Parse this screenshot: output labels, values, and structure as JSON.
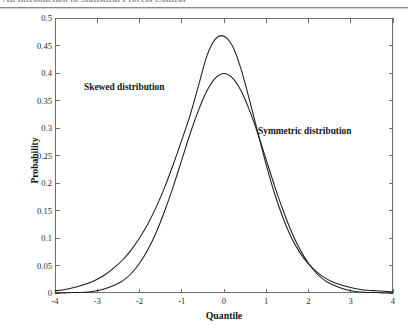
{
  "page": {
    "header_text": "An Introduction to Statistical Process Control",
    "background_color": "#ffffff",
    "ink_color": "#1a1a1a"
  },
  "figure": {
    "frame_color": "#6d6d70",
    "curve_color": "#1c1c1e",
    "annotations": [
      {
        "name": "skewed-label",
        "text": "Skewed distribution"
      },
      {
        "name": "symmetric-label",
        "text": "Symmetric distribution"
      }
    ]
  },
  "chart_data": {
    "type": "line",
    "title": "",
    "xlabel": "Quantile",
    "ylabel": "Probability",
    "xlim": [
      -4,
      4
    ],
    "ylim": [
      0,
      0.5
    ],
    "grid": false,
    "legend": "inline-annotations",
    "xticks": [
      -4,
      -3,
      -2,
      -1,
      0,
      1,
      2,
      3,
      4
    ],
    "xticklabels": [
      "-4",
      "-3",
      "-2",
      "-1",
      "0",
      "1",
      "2",
      "3",
      "4"
    ],
    "yticks": [
      0,
      0.05,
      0.1,
      0.15,
      0.2,
      0.25,
      0.3,
      0.35,
      0.4,
      0.45,
      0.5
    ],
    "yticklabels": [
      "0",
      "0.05",
      "0.1",
      "0.15",
      "0.2",
      "0.25",
      "0.3",
      "0.35",
      "0.4",
      "0.45",
      "0.5"
    ],
    "annotations": [
      {
        "text": "Skewed distribution",
        "x": -2.45,
        "y": 0.385
      },
      {
        "text": "Symmetric distribution",
        "x": 1.45,
        "y": 0.305
      }
    ],
    "x": [
      -4.0,
      -3.8,
      -3.6,
      -3.4,
      -3.2,
      -3.0,
      -2.8,
      -2.6,
      -2.4,
      -2.2,
      -2.0,
      -1.8,
      -1.6,
      -1.4,
      -1.2,
      -1.0,
      -0.8,
      -0.6,
      -0.4,
      -0.2,
      0.0,
      0.2,
      0.4,
      0.6,
      0.8,
      1.0,
      1.2,
      1.4,
      1.6,
      1.8,
      2.0,
      2.2,
      2.4,
      2.6,
      2.8,
      3.0,
      3.2,
      3.4,
      3.6,
      3.8,
      4.0
    ],
    "series": [
      {
        "name": "Skewed distribution",
        "values": [
          0.004,
          0.006,
          0.009,
          0.013,
          0.018,
          0.025,
          0.034,
          0.046,
          0.06,
          0.078,
          0.1,
          0.126,
          0.157,
          0.193,
          0.234,
          0.278,
          0.324,
          0.378,
          0.432,
          0.462,
          0.467,
          0.449,
          0.408,
          0.352,
          0.292,
          0.233,
          0.18,
          0.136,
          0.1,
          0.073,
          0.053,
          0.038,
          0.027,
          0.019,
          0.014,
          0.01,
          0.007,
          0.005,
          0.004,
          0.003,
          0.002
        ]
      },
      {
        "name": "Symmetric distribution",
        "values": [
          0.0,
          0.0,
          0.001,
          0.001,
          0.002,
          0.004,
          0.008,
          0.014,
          0.022,
          0.035,
          0.054,
          0.079,
          0.111,
          0.15,
          0.194,
          0.242,
          0.29,
          0.333,
          0.368,
          0.391,
          0.399,
          0.391,
          0.368,
          0.333,
          0.29,
          0.242,
          0.194,
          0.15,
          0.111,
          0.079,
          0.054,
          0.035,
          0.022,
          0.014,
          0.008,
          0.004,
          0.002,
          0.001,
          0.001,
          0.0,
          0.0
        ]
      }
    ]
  }
}
